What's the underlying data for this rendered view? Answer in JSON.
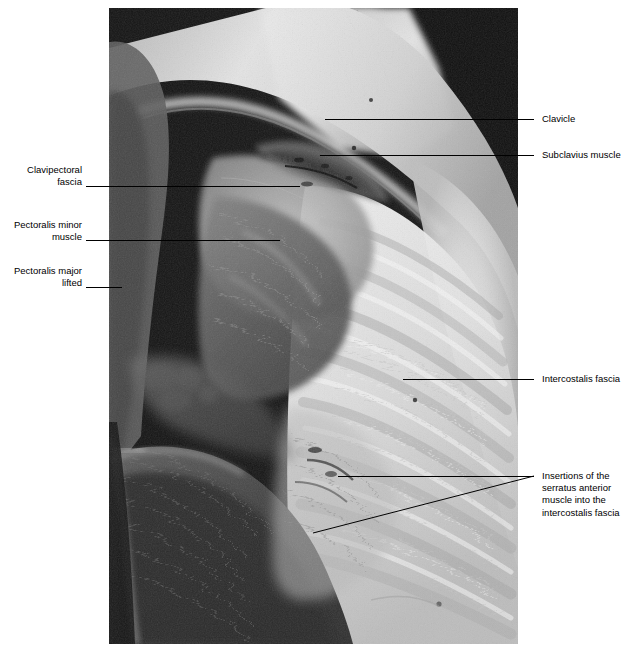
{
  "figure": {
    "type": "anatomical-dissection-photograph",
    "view": "Pectoralis major reflected to expose clavipectoral fascia, pectoralis minor and thoracic wall",
    "photo": {
      "x": 109,
      "y": 8,
      "width": 409,
      "height": 636,
      "palette": {
        "background_black": "#0d0d0d",
        "dark_muscle": "#3a3a3a",
        "mid_tissue": "#8e8e8e",
        "light_fascia": "#d6d6d6",
        "highlight": "#f4f4f4"
      }
    },
    "line_color": "#000000",
    "text_color": "#000000"
  },
  "labels": {
    "left": [
      {
        "id": "clavipectoral-fascia",
        "text": "Clavipectoral\nfascia",
        "text_right_x": 82,
        "text_top_y": 164,
        "leader": {
          "x1": 86,
          "y1": 186,
          "x2": 300,
          "y2": 186
        }
      },
      {
        "id": "pectoralis-minor-muscle",
        "text": "Pectoralis minor\nmuscle",
        "text_right_x": 82,
        "text_top_y": 219,
        "leader": {
          "x1": 86,
          "y1": 240,
          "x2": 280,
          "y2": 240
        }
      },
      {
        "id": "pectoralis-major-lifted",
        "text": "Pectoralis major\nlifted",
        "text_right_x": 82,
        "text_top_y": 265,
        "leader": {
          "x1": 86,
          "y1": 287,
          "x2": 122,
          "y2": 287
        }
      }
    ],
    "right": [
      {
        "id": "clavicle",
        "text": "Clavicle",
        "text_left_x": 542,
        "text_top_y": 113,
        "leader": {
          "x1": 325,
          "y1": 119,
          "x2": 534,
          "y2": 119
        }
      },
      {
        "id": "subclavius-muscle",
        "text": "Subclavius muscle",
        "text_left_x": 542,
        "text_top_y": 149,
        "leader": {
          "x1": 320,
          "y1": 155,
          "x2": 534,
          "y2": 155
        }
      },
      {
        "id": "intercostalis-fascia",
        "text": "Intercostalis fascia",
        "text_left_x": 542,
        "text_top_y": 373,
        "leader": {
          "x1": 403,
          "y1": 379,
          "x2": 534,
          "y2": 379
        }
      },
      {
        "id": "insertions-serratus-anterior",
        "text": "Insertions of the\nserratus anterior\nmuscle into the\nintercostalis fascia",
        "text_left_x": 542,
        "text_top_y": 470,
        "leader": {
          "x1": 338,
          "y1": 476,
          "x2": 534,
          "y2": 476
        },
        "leader2": {
          "x1": 313,
          "y1": 533,
          "x2": 534,
          "y2": 476
        }
      }
    ]
  }
}
